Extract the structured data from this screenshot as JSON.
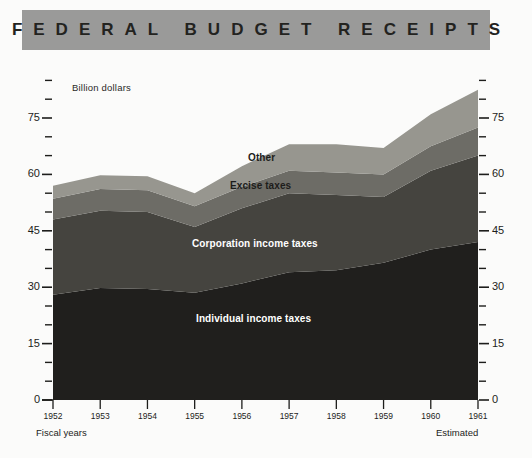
{
  "header": {
    "title": "FEDERAL BUDGET RECEIPTS",
    "bar_color": "#9a9a99"
  },
  "chart_data": {
    "type": "area",
    "title": "FEDERAL BUDGET RECEIPTS",
    "subtitle": "Billion dollars",
    "stacked": true,
    "xlabel": "Fiscal years",
    "ylabel": "Billion dollars",
    "x_note_right": "Estimated",
    "grid": false,
    "legend": "inline-labels",
    "ylim": [
      0,
      90
    ],
    "yticks_major": [
      0,
      15,
      30,
      45,
      60,
      75
    ],
    "yticks_minor_step": 5,
    "categories": [
      "1952",
      "1953",
      "1954",
      "1955",
      "1956",
      "1957",
      "1958",
      "1959",
      "1960",
      "1961"
    ],
    "series": [
      {
        "name": "Individual income taxes",
        "color": "#201f1d",
        "values": [
          28.0,
          29.8,
          29.5,
          28.5,
          31.0,
          34.0,
          34.5,
          36.5,
          40.0,
          42.0
        ]
      },
      {
        "name": "Corporation income taxes",
        "color": "#45443f",
        "values": [
          20.0,
          20.5,
          20.5,
          17.5,
          20.0,
          21.0,
          20.0,
          17.5,
          21.0,
          23.0
        ]
      },
      {
        "name": "Excise taxes",
        "color": "#6d6c66",
        "values": [
          5.5,
          5.8,
          5.8,
          5.5,
          5.7,
          6.0,
          6.0,
          6.0,
          6.5,
          7.5
        ]
      },
      {
        "name": "Other",
        "color": "#97968f",
        "values": [
          3.5,
          3.7,
          3.7,
          3.5,
          5.5,
          7.0,
          7.5,
          7.0,
          8.5,
          10.0
        ]
      }
    ],
    "totals": [
      57.0,
      59.8,
      59.5,
      55.0,
      62.2,
      68.0,
      68.0,
      67.0,
      76.0,
      82.5
    ]
  },
  "axes": {
    "left_labels": [
      "75",
      "60",
      "45",
      "30",
      "15",
      "0"
    ],
    "right_labels": [
      "75",
      "60",
      "45",
      "30",
      "15",
      "0"
    ]
  },
  "footer": {
    "left": "Fiscal years",
    "right": "Estimated"
  }
}
